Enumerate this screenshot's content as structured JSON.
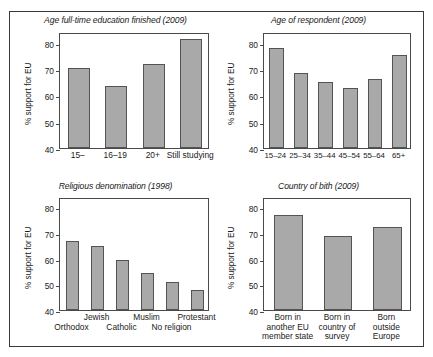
{
  "figure": {
    "ylabel": "% support for EU",
    "y_ticks": [
      "40",
      "50",
      "60",
      "70",
      "80"
    ],
    "bar_color": "#a9a9a9",
    "bar_edge_color": "#545454",
    "frame_color": "#3a3a3a"
  },
  "chart_data": [
    {
      "id": "education",
      "type": "bar",
      "title": "Age full-time education finished (2009)",
      "xlabel": "",
      "ylabel": "% support for EU",
      "ylim": [
        40,
        84
      ],
      "yticks": [
        40,
        50,
        60,
        70,
        80
      ],
      "grid": false,
      "legend": "none",
      "categories": [
        "15–",
        "16–19",
        "20+",
        "Still studying"
      ],
      "values": [
        70.2,
        63.5,
        71.9,
        81.2
      ]
    },
    {
      "id": "age",
      "type": "bar",
      "title": "Age of respondent (2009)",
      "xlabel": "",
      "ylabel": "% support for EU",
      "ylim": [
        40,
        84
      ],
      "yticks": [
        40,
        50,
        60,
        70,
        80
      ],
      "grid": false,
      "legend": "none",
      "categories": [
        "15–24",
        "25–34",
        "35–44",
        "45–54",
        "55–64",
        "65+"
      ],
      "values": [
        78.1,
        68.6,
        65.0,
        62.9,
        66.1,
        75.3
      ]
    },
    {
      "id": "religion",
      "type": "bar",
      "title": "Religious denomination (1998)",
      "xlabel": "",
      "ylabel": "% support for EU",
      "ylim": [
        40,
        84
      ],
      "yticks": [
        40,
        50,
        60,
        70,
        80
      ],
      "grid": false,
      "legend": "none",
      "categories": [
        "Orthodox",
        "Jewish",
        "Catholic",
        "Muslim",
        "No religion",
        "Protestant"
      ],
      "values": [
        66.9,
        65.0,
        59.5,
        54.3,
        51.0,
        47.9
      ]
    },
    {
      "id": "birth",
      "type": "bar",
      "title": "Country of bith (2009)",
      "xlabel": "",
      "ylabel": "% support for EU",
      "ylim": [
        40,
        84
      ],
      "yticks": [
        40,
        50,
        60,
        70,
        80
      ],
      "grid": false,
      "legend": "none",
      "categories": [
        "Born in\nanother EU\nmember state",
        "Born in\ncountry of\nsurvey",
        "Born\noutside\nEurope"
      ],
      "values": [
        76.9,
        68.9,
        72.5
      ]
    }
  ]
}
